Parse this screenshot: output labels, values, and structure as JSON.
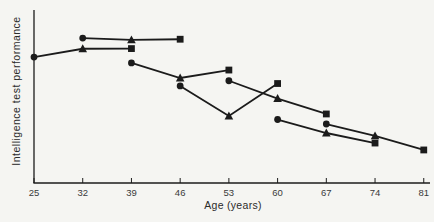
{
  "figure": {
    "background": "#f5f5f2",
    "ink": "#1b1b1b",
    "tick_label_color": "#3a3a3a",
    "axis_label_color": "#2b2b2b"
  },
  "chart_data": {
    "type": "line",
    "title": "",
    "xlabel": "Age (years)",
    "ylabel": "Intelligence test performance",
    "x_ticks": [
      25,
      32,
      39,
      46,
      53,
      60,
      67,
      74,
      81
    ],
    "xlim": [
      25,
      82
    ],
    "ylim": [
      0,
      100
    ],
    "y_axis_tick_labels": "none (arbitrary units, values estimated on 0-100 scale)",
    "grid": false,
    "legend": "none",
    "marker_sequence": [
      "circle",
      "triangle",
      "square"
    ],
    "series": [
      {
        "name": "cohort-age-25-39",
        "x": [
          25,
          32,
          39
        ],
        "values": [
          72.8,
          77.6,
          77.7
        ]
      },
      {
        "name": "cohort-age-32-46",
        "x": [
          32,
          39,
          46
        ],
        "values": [
          83.8,
          82.7,
          83.1
        ]
      },
      {
        "name": "cohort-age-39-53",
        "x": [
          39,
          46,
          53
        ],
        "values": [
          69.4,
          60.7,
          65.3
        ]
      },
      {
        "name": "cohort-age-46-60",
        "x": [
          46,
          53,
          60
        ],
        "values": [
          56.1,
          38.7,
          57.5
        ]
      },
      {
        "name": "cohort-age-53-67",
        "x": [
          53,
          60,
          67
        ],
        "values": [
          59.1,
          48.8,
          39.9
        ]
      },
      {
        "name": "cohort-age-60-74",
        "x": [
          60,
          67,
          74
        ],
        "values": [
          36.7,
          28.9,
          23.1
        ]
      },
      {
        "name": "cohort-age-67-81",
        "x": [
          67,
          74,
          81
        ],
        "values": [
          34.1,
          27.2,
          19.1
        ]
      }
    ]
  }
}
